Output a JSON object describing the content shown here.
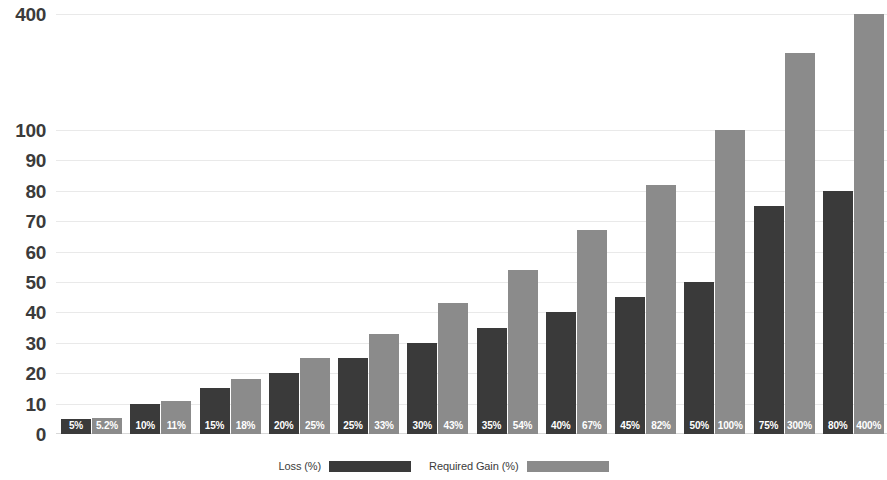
{
  "chart_data": {
    "type": "bar",
    "title": "",
    "xlabel": "",
    "ylabel": "",
    "grid": true,
    "legend_position": "bottom",
    "y_axis": {
      "ticks": [
        0,
        10,
        20,
        30,
        40,
        50,
        60,
        70,
        80,
        90,
        100,
        400
      ],
      "tick_labels": [
        "0",
        "10",
        "20",
        "30",
        "40",
        "50",
        "60",
        "70",
        "80",
        "90",
        "100",
        "400"
      ],
      "scale": "broken-linear",
      "ylim": [
        0,
        400
      ]
    },
    "categories": [
      "5%",
      "10%",
      "15%",
      "20%",
      "25%",
      "30%",
      "35%",
      "40%",
      "45%",
      "50%",
      "75%",
      "80%"
    ],
    "series": [
      {
        "name": "Loss (%)",
        "color": "#3a3a3a",
        "values": [
          5,
          10,
          15,
          20,
          25,
          30,
          35,
          40,
          45,
          50,
          75,
          80
        ],
        "labels": [
          "5%",
          "10%",
          "15%",
          "20%",
          "25%",
          "30%",
          "35%",
          "40%",
          "45%",
          "50%",
          "75%",
          "80%"
        ]
      },
      {
        "name": "Required Gain (%)",
        "color": "#8b8b8b",
        "values": [
          5.2,
          11,
          18,
          25,
          33,
          43,
          54,
          67,
          82,
          100,
          300,
          400
        ],
        "labels": [
          "5.2%",
          "11%",
          "18%",
          "25%",
          "33%",
          "43%",
          "54%",
          "67%",
          "82%",
          "100%",
          "300%",
          "400%"
        ]
      }
    ]
  },
  "legend": {
    "entries": [
      {
        "label": "Loss (%)",
        "color": "#3a3a3a"
      },
      {
        "label": "Required Gain (%)",
        "color": "#8b8b8b"
      }
    ]
  }
}
